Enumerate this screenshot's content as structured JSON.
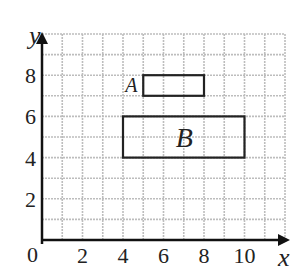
{
  "diagram": {
    "type": "coordinate-grid",
    "axes": {
      "x_label": "x",
      "y_label": "y",
      "origin_label": "0",
      "x_ticks": [
        "2",
        "4",
        "6",
        "8",
        "10"
      ],
      "y_ticks": [
        "2",
        "4",
        "6",
        "8"
      ],
      "x_range": [
        0,
        12
      ],
      "y_range": [
        0,
        10
      ]
    },
    "shapes": [
      {
        "label": "A",
        "x1": 5,
        "y1": 7,
        "x2": 8,
        "y2": 8
      },
      {
        "label": "B",
        "x1": 4,
        "y1": 4,
        "x2": 10,
        "y2": 6
      }
    ],
    "colors": {
      "grid": "#bdbdbd",
      "axis": "#111111",
      "shape": "#222222"
    }
  }
}
